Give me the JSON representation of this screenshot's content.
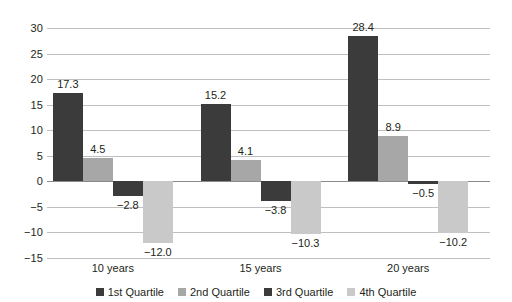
{
  "chart_data": {
    "type": "bar",
    "title": "",
    "subtitle": "",
    "xlabel": "",
    "ylabel": "",
    "categories": [
      "10 years",
      "15 years",
      "20 years"
    ],
    "series": [
      {
        "name": "1st Quartile",
        "color": "#3b3b3b",
        "values": [
          17.3,
          15.2,
          28.4
        ],
        "labels": [
          "17.3",
          "15.2",
          "28.4"
        ]
      },
      {
        "name": "2nd Quartile",
        "color": "#a7a7a7",
        "values": [
          4.5,
          4.1,
          8.9
        ],
        "labels": [
          "4.5",
          "4.1",
          "8.9"
        ]
      },
      {
        "name": "3rd Quartile",
        "color": "#3b3b3b",
        "values": [
          -2.8,
          -3.8,
          -0.5
        ],
        "labels": [
          "−2.8",
          "−3.8",
          "−0.5"
        ]
      },
      {
        "name": "4th Quartile",
        "color": "#c9c9c9",
        "values": [
          -12.0,
          -10.3,
          -10.2
        ],
        "labels": [
          "−12.0",
          "−10.3",
          "−10.2"
        ]
      }
    ],
    "ylim": [
      -15,
      30
    ],
    "yticks": [
      30,
      25,
      20,
      15,
      10,
      5,
      0,
      -5,
      -10,
      -15
    ],
    "ytick_labels": [
      "30",
      "25",
      "20",
      "15",
      "10",
      "5",
      "0",
      "−5",
      "−10",
      "−15"
    ],
    "grid": true,
    "legend_position": "bottom",
    "colors": {
      "quartile1": "#3b3b3b",
      "quartile2": "#a7a7a7",
      "quartile3": "#3b3b3b",
      "quartile4": "#c9c9c9",
      "gridline": "#bfbfbf",
      "zeroline": "#8a8a8a",
      "text": "#231f20",
      "background": "#ffffff"
    }
  },
  "legend": {
    "items": [
      {
        "label": "1st Quartile"
      },
      {
        "label": "2nd Quartile"
      },
      {
        "label": "3rd Quartile"
      },
      {
        "label": "4th Quartile"
      }
    ]
  }
}
